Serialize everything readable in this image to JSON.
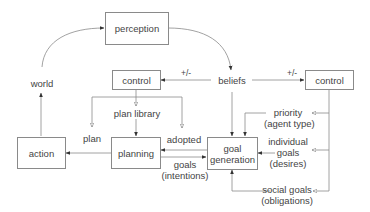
{
  "nodes": {
    "perception": {
      "label": "perception"
    },
    "control_left": {
      "label": "control"
    },
    "beliefs": {
      "label": "beliefs"
    },
    "control_right": {
      "label": "control"
    },
    "world": {
      "label": "world"
    },
    "action": {
      "label": "action"
    },
    "planning": {
      "label": "planning"
    },
    "goal_generation": {
      "line1": "goal",
      "line2": "generation"
    }
  },
  "edge_labels": {
    "plus_minus_left": "+/-",
    "plus_minus_right": "+/-",
    "plan_library": "plan library",
    "plan": "plan",
    "adopted": "adopted",
    "goals_intentions": {
      "line1": "goals",
      "line2": "(intentions)"
    },
    "priority": {
      "line1": "priority",
      "line2": "(agent type)"
    },
    "individual_goals": {
      "line1": "individual",
      "line2": "goals",
      "line3": "(desires)"
    },
    "social_goals": {
      "line1": "social goals",
      "line2": "(obligations)"
    }
  },
  "colors": {
    "line": "#8a8a8a",
    "arrow": "#333333",
    "text": "#444444"
  }
}
